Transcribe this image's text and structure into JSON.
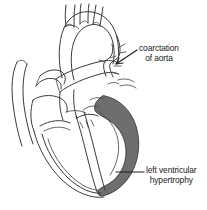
{
  "figure": {
    "type": "anatomical line illustration",
    "background_color": "#ffffff",
    "line_color": "#3a3a3a",
    "shade_color": "#6e6e6e",
    "text_color": "#1a1a1a"
  },
  "labels": {
    "coarctation": {
      "line1": "coarctation",
      "line2": "of aorta",
      "leader": "diagonal-arrow"
    },
    "lvh": {
      "line1": "left ventricular",
      "line2": "hypertrophy",
      "leader": "horizontal-line"
    }
  },
  "icons": {
    "leader_arrow": "arrow-leader-icon",
    "leader_dash": "dash-leader-icon"
  }
}
